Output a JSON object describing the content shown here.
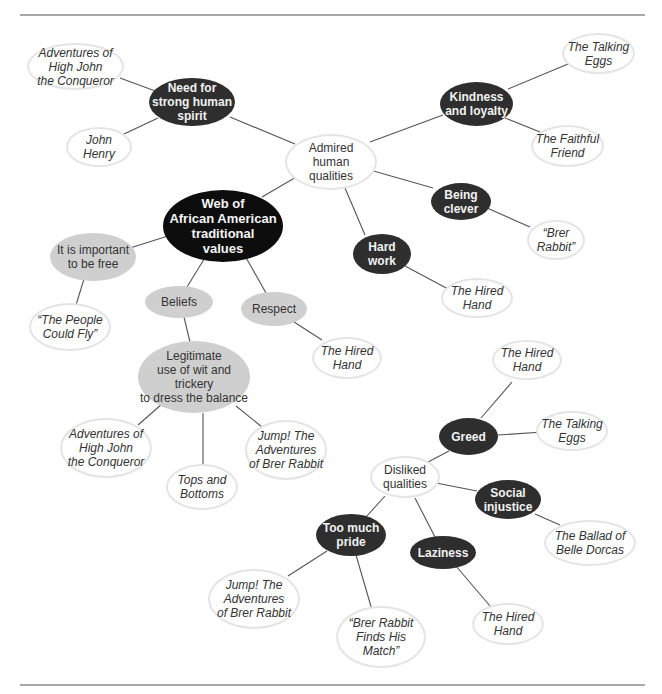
{
  "title": "Web of African American traditional values",
  "colors": {
    "root": "#0d0d0d",
    "quality": "#2e2e2e",
    "belief": "#cfcfcf",
    "story_border": "#e4e4e4",
    "link": "#555555",
    "rule": "#a8a8a8"
  },
  "nodes": {
    "root": {
      "label": "Web of\nAfrican American\ntraditional\nvalues"
    },
    "admired": {
      "label": "Admired\nhuman\nqualities"
    },
    "need_spirit": {
      "label": "Need for\nstrong human\nspirit"
    },
    "high_john_1": {
      "label": "Adventures of\nHigh John\nthe Conqueror"
    },
    "john_henry": {
      "label": "John\nHenry"
    },
    "kindness": {
      "label": "Kindness\nand loyalty"
    },
    "talking_eggs_1": {
      "label": "The Talking\nEggs"
    },
    "faithful_friend": {
      "label": "The Faithful\nFriend"
    },
    "clever": {
      "label": "Being\nclever"
    },
    "brer_rabbit": {
      "label": "“Brer\nRabbit”"
    },
    "hard_work": {
      "label": "Hard\nwork"
    },
    "hired_hand_1": {
      "label": "The Hired\nHand"
    },
    "free": {
      "label": "It is important\nto be free"
    },
    "people_fly": {
      "label": "“The People\nCould Fly”"
    },
    "beliefs": {
      "label": "Beliefs"
    },
    "respect": {
      "label": "Respect"
    },
    "hired_hand_2": {
      "label": "The Hired\nHand"
    },
    "wit": {
      "label": "Legitimate\nuse of wit and trickery\nto dress the balance"
    },
    "high_john_2": {
      "label": "Adventures of\nHigh John\nthe Conqueror"
    },
    "tops_bottoms": {
      "label": "Tops and\nBottoms"
    },
    "jump_1": {
      "label": "Jump! The\nAdventures\nof Brer Rabbit"
    },
    "disliked": {
      "label": "Disliked\nqualities"
    },
    "greed": {
      "label": "Greed"
    },
    "hired_hand_3": {
      "label": "The Hired\nHand"
    },
    "talking_eggs_2": {
      "label": "The Talking\nEggs"
    },
    "social": {
      "label": "Social\ninjustice"
    },
    "belle_dorcas": {
      "label": "The Ballad of\nBelle Dorcas"
    },
    "pride": {
      "label": "Too much\npride"
    },
    "jump_2": {
      "label": "Jump! The\nAdventures\nof Brer Rabbit"
    },
    "brer_match": {
      "label": "“Brer Rabbit\nFinds His\nMatch”"
    },
    "laziness": {
      "label": "Laziness"
    },
    "hired_hand_4": {
      "label": "The Hired\nHand"
    }
  }
}
